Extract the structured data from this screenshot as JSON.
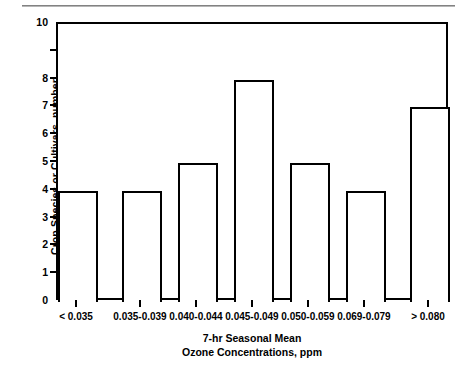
{
  "chart_data": {
    "type": "bar",
    "title": "",
    "subtitle": "",
    "categories": [
      "< 0.035",
      "0.035-0.039",
      "0.040-0.044",
      "0.045-0.049",
      "0.050-0.059",
      "0.069-0.079",
      "> 0.080"
    ],
    "values": [
      4,
      4,
      5,
      8,
      5,
      4,
      7
    ],
    "xlabel": "7-hr Seasonal Mean Ozone Concentrations, ppm",
    "xlabel_line1": "7-hr Seasonal Mean",
    "xlabel_line2": "Ozone Concentrations, ppm",
    "ylabel": "Crop Species or Cultivars, number",
    "ylim": [
      0,
      10
    ],
    "yticks": [
      0,
      1,
      2,
      3,
      4,
      5,
      6,
      7,
      8,
      9,
      10
    ],
    "ytick_labels": [
      "0",
      "1",
      "2",
      "3",
      "4",
      "5",
      "6",
      "7",
      "8",
      "",
      "10"
    ],
    "grid": false,
    "legend": "none",
    "bar_fill": "#ffffff",
    "bar_edge": "#000000",
    "axis_color": "#000000",
    "background": "#ffffff",
    "rule_color": "#8a8a8a"
  }
}
